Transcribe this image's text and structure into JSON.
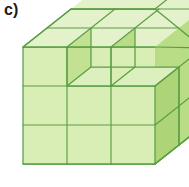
{
  "figure": {
    "label": "c)",
    "caption_text": "c)",
    "description": "Isometric drawing of a stack of unit cubes forming a 3 by 3 by 3 block with cubes removed from the top layer",
    "projection": "cabinet-oblique",
    "grid": {
      "width_cubes": 3,
      "height_cubes": 3,
      "depth_cubes": 3
    },
    "counts": {
      "front_face_squares": 8,
      "top_face_squares": 8,
      "right_face_squares": 8
    },
    "colors": {
      "front_face": "#d8eeb4",
      "top_face": "#e4f2cb",
      "right_face": "#b9dd86",
      "right_face_dark": "#aed478",
      "inner_left_face": "#c3e193",
      "inner_floor_face": "#dcefbe",
      "edge_stroke": "#5a9e44",
      "edge_stroke_light": "#7fbc5f",
      "label_color": "#1a1a1a",
      "background": "#ffffff"
    },
    "geometry": {
      "unit_front_width": 44,
      "unit_front_height": 39,
      "depth_dx": 24,
      "depth_dy": -19,
      "origin_x": 23,
      "origin_y": 164
    },
    "faces": {
      "front_lower_rows": [
        {
          "row": "bottom",
          "cells": 3
        },
        {
          "row": "middle",
          "cells": 3
        }
      ],
      "front_top_row_cells": 2,
      "top_layer_notch": "one cube removed from the top-front-middle position creating a recessed step"
    }
  }
}
